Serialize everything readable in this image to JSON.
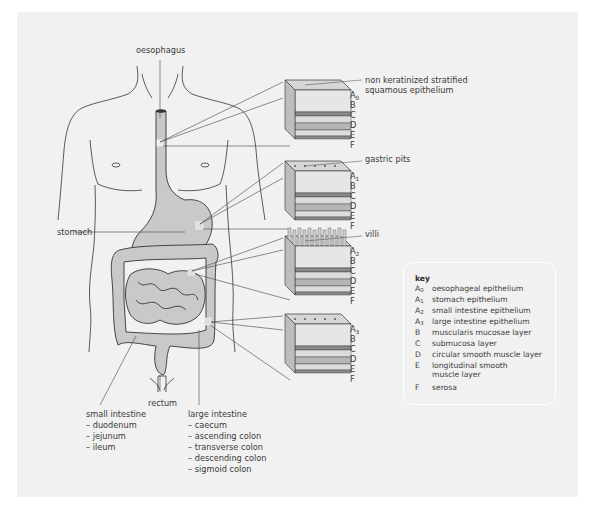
{
  "figure": {
    "organ_labels": {
      "oesophagus": "oesophagus",
      "stomach": "stomach",
      "rectum": "rectum"
    },
    "small_intestine": {
      "title": "small intestine",
      "parts": [
        "– duodenum",
        "– jejunum",
        "– ileum"
      ]
    },
    "large_intestine": {
      "title": "large intestine",
      "parts": [
        "– caecum",
        "– ascending colon",
        "– transverse colon",
        "– descending colon",
        "– sigmoid colon"
      ]
    },
    "tissue_blocks": [
      {
        "id": "oesophagus-block",
        "surface_label": [
          "non keratinized stratified",
          "squamous epithelium"
        ],
        "epithelium_code": "A",
        "epithelium_sub": "0",
        "layers": [
          "B",
          "C",
          "D",
          "E",
          "F"
        ]
      },
      {
        "id": "stomach-block",
        "surface_label": [
          "gastric pits"
        ],
        "epithelium_code": "A",
        "epithelium_sub": "1",
        "layers": [
          "B",
          "C",
          "D",
          "E",
          "F"
        ]
      },
      {
        "id": "small-intestine-block",
        "surface_label": [
          "villi"
        ],
        "epithelium_code": "A",
        "epithelium_sub": "2",
        "layers": [
          "B",
          "C",
          "D",
          "E",
          "F"
        ]
      },
      {
        "id": "large-intestine-block",
        "surface_label": [],
        "epithelium_code": "A",
        "epithelium_sub": "3",
        "layers": [
          "B",
          "C",
          "D",
          "E",
          "F"
        ]
      }
    ],
    "colors": {
      "background_panel": "#f1f1f1",
      "organ_fill": "#c9c9c9",
      "outline": "#333333",
      "layer_dark": "#8a8a8a",
      "layer_mid": "#b5b5b5",
      "layer_light": "#dcdcdc"
    }
  },
  "key": {
    "title": "key",
    "items": [
      {
        "code": "A",
        "sub": "0",
        "desc": "oesophageal epithelium"
      },
      {
        "code": "A",
        "sub": "1",
        "desc": "stomach epithelium"
      },
      {
        "code": "A",
        "sub": "2",
        "desc": "small intestine epithelium"
      },
      {
        "code": "A",
        "sub": "3",
        "desc": "large intestine epithelium"
      },
      {
        "code": "B",
        "sub": "",
        "desc": "muscularis mucosae layer"
      },
      {
        "code": "C",
        "sub": "",
        "desc": "submucosa layer"
      },
      {
        "code": "D",
        "sub": "",
        "desc": "circular smooth muscle layer"
      },
      {
        "code": "E",
        "sub": "",
        "desc": "longitudinal smooth\nmuscle layer"
      },
      {
        "code": "F",
        "sub": "",
        "desc": "serosa"
      }
    ]
  }
}
